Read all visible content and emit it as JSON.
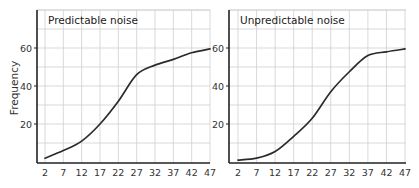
{
  "chart_data": [
    {
      "type": "line",
      "title": "Predictable noise",
      "xlabel": "",
      "ylabel": "Frequency",
      "x": [
        2,
        7,
        12,
        17,
        22,
        27,
        32,
        37,
        42,
        47
      ],
      "series": [
        {
          "name": "Predictable noise",
          "values": [
            2,
            6,
            11,
            20,
            32,
            46,
            51,
            54,
            57.5,
            59.5
          ]
        }
      ],
      "x_ticks": [
        "2",
        "7",
        "12",
        "17",
        "22",
        "27",
        "32",
        "37",
        "42",
        "47"
      ],
      "y_ticks": [
        "20",
        "40",
        "60"
      ],
      "ylim": [
        0,
        80
      ],
      "xlim": [
        0,
        47
      ],
      "grid": true,
      "legend": "none"
    },
    {
      "type": "line",
      "title": "Unpredictable noise",
      "xlabel": "",
      "ylabel": "",
      "x": [
        2,
        7,
        12,
        17,
        22,
        27,
        32,
        37,
        42,
        47
      ],
      "series": [
        {
          "name": "Unpredictable noise",
          "values": [
            1,
            2,
            5.5,
            13.5,
            23,
            37,
            47.5,
            56,
            58,
            59.5
          ]
        }
      ],
      "x_ticks": [
        "2",
        "7",
        "12",
        "17",
        "22",
        "27",
        "32",
        "37",
        "42",
        "47"
      ],
      "y_ticks": [
        "20",
        "40",
        "60"
      ],
      "ylim": [
        0,
        80
      ],
      "xlim": [
        0,
        47
      ],
      "grid": true,
      "legend": "none"
    }
  ],
  "colors": {
    "line": "#2b2b2b",
    "grid": "#cfcfcf",
    "axis": "#222222"
  }
}
